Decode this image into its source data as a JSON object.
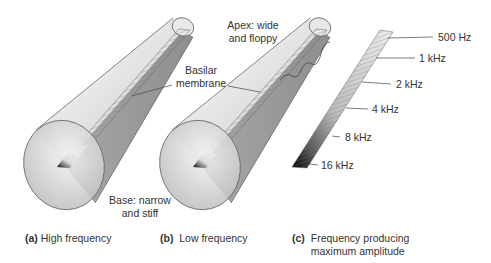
{
  "labels": {
    "apex_line1": "Apex: wide",
    "apex_line2": "and floppy",
    "basilar_line1": "Basilar",
    "basilar_line2": "membrane",
    "base_line1": "Base: narrow",
    "base_line2": "and stiff"
  },
  "captions": [
    {
      "letter": "(a)",
      "text": "High frequency"
    },
    {
      "letter": "(b)",
      "text": "Low frequency"
    },
    {
      "letter": "(c)",
      "text_line1": "Frequency producing",
      "text_line2": "maximum amplitude"
    }
  ],
  "frequency_scale": [
    {
      "label": "500 Hz"
    },
    {
      "label": "1 kHz"
    },
    {
      "label": "2 kHz"
    },
    {
      "label": "4 kHz"
    },
    {
      "label": "8 kHz"
    },
    {
      "label": "16 kHz"
    }
  ],
  "colors": {
    "cone_fill_light": "#f0f0f0",
    "cone_fill_dark": "#9a9a9a",
    "outline": "#555555",
    "membrane_dark": "#111111"
  }
}
